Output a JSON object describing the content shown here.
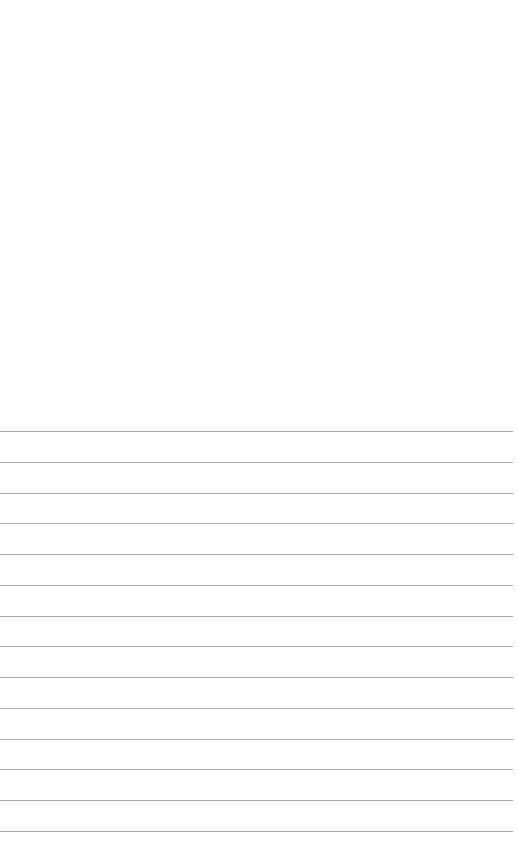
{
  "page": {
    "kind": "ruled-paper-sheet",
    "width": 517,
    "height": 866,
    "background_color": "#ffffff",
    "has_visible_text": false,
    "notes": ""
  },
  "blank_header": {
    "label": "",
    "top": 0,
    "height": 428
  },
  "ruled_area": {
    "label": "",
    "top": 428,
    "height": 438,
    "line_color": "#a8a8ac",
    "line_thickness": 1,
    "line_spacing": 30.7,
    "line_left": 0,
    "line_width": 513,
    "line_count": 13,
    "lines": [
      {
        "index": 1,
        "label": "",
        "y": 431,
        "width": 513
      },
      {
        "index": 2,
        "label": "",
        "y": 462,
        "width": 513
      },
      {
        "index": 3,
        "label": "",
        "y": 493,
        "width": 513
      },
      {
        "index": 4,
        "label": "",
        "y": 523,
        "width": 513
      },
      {
        "index": 5,
        "label": "",
        "y": 554,
        "width": 513
      },
      {
        "index": 6,
        "label": "",
        "y": 585,
        "width": 513
      },
      {
        "index": 7,
        "label": "",
        "y": 616,
        "width": 513
      },
      {
        "index": 8,
        "label": "",
        "y": 646,
        "width": 513
      },
      {
        "index": 9,
        "label": "",
        "y": 677,
        "width": 513
      },
      {
        "index": 10,
        "label": "",
        "y": 708,
        "width": 513
      },
      {
        "index": 11,
        "label": "",
        "y": 739,
        "width": 513
      },
      {
        "index": 12,
        "label": "",
        "y": 769,
        "width": 513
      },
      {
        "index": 13,
        "label": "",
        "y": 800,
        "width": 513
      },
      {
        "index": 14,
        "label": "",
        "y": 831,
        "width": 513
      }
    ]
  },
  "blank_footer": {
    "label": "",
    "height": 34
  }
}
